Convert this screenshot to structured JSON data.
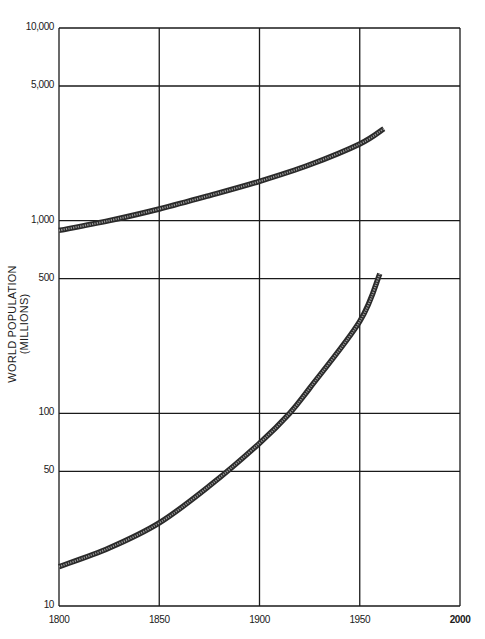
{
  "chart_data": {
    "type": "line",
    "title": "",
    "xlabel": "",
    "ylabel": "WORLD POPULATION (MILLIONS)",
    "yscale": "log",
    "xlim": [
      1800,
      2000
    ],
    "ylim": [
      10,
      10000
    ],
    "grid": true,
    "legend": null,
    "x_ticks": [
      "1800",
      "1850",
      "1900",
      "1950",
      "2000"
    ],
    "y_ticks": [
      "10,000",
      "5,000",
      "1,000",
      "500",
      "100",
      "50",
      "10"
    ],
    "series": [
      {
        "name": "upper curve",
        "x": [
          1800,
          1825,
          1850,
          1875,
          1900,
          1925,
          1950,
          1962
        ],
        "values": [
          890,
          1000,
          1150,
          1350,
          1600,
          1950,
          2500,
          3000
        ]
      },
      {
        "name": "lower curve",
        "x": [
          1800,
          1825,
          1850,
          1875,
          1900,
          1915,
          1925,
          1950,
          1960
        ],
        "values": [
          16,
          20,
          27,
          42,
          70,
          100,
          135,
          300,
          530
        ]
      }
    ]
  }
}
